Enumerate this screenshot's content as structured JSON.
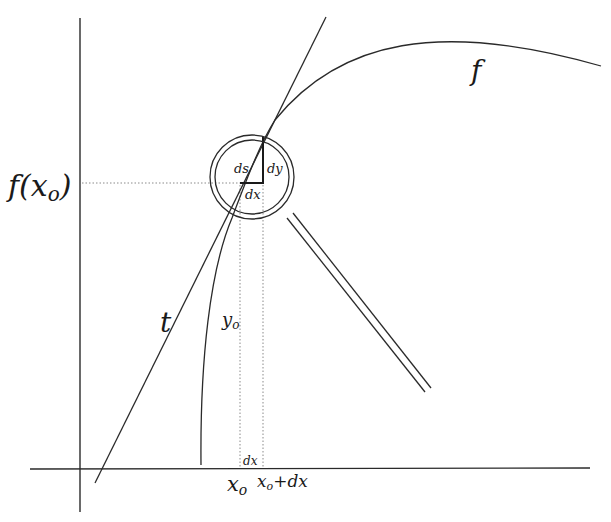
{
  "diagram": {
    "colors": {
      "stroke": "#2a2a2a",
      "dotted": "#8a8a8a",
      "background": "#ffffff"
    },
    "labels": {
      "f_of_x0": "f(x",
      "f_of_x0_sub": "o",
      "f_of_x0_close": ")",
      "curve": "f",
      "tangent": "t",
      "y0": "y",
      "y0_sub": "o",
      "ds": "ds",
      "dy": "dy",
      "dx_triangle": "dx",
      "dx_axis": "dx",
      "x0": "x",
      "x0_sub": "o",
      "x0_plus_dx": "x",
      "x0_plus_dx_sub": "o",
      "x0_plus_dx_tail": "+dx"
    }
  }
}
